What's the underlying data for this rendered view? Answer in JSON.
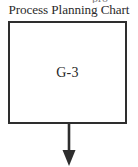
{
  "chart": {
    "title": "Process Planning Chart",
    "clipped_text_above": "pro",
    "background_color": "#ffffff",
    "line_color": "#2e2e2e",
    "text_color": "#2b2b2b"
  },
  "nodes": [
    {
      "id": "node-g3",
      "label": "G-3",
      "shape": "rectangle",
      "border_color": "#2e2e2e",
      "fill_color": "#ffffff"
    }
  ],
  "connectors": [
    {
      "id": "arrow-down-from-g3",
      "type": "arrow",
      "direction": "down",
      "from": "node-g3",
      "to": "",
      "label": "",
      "color": "#2e2e2e"
    }
  ]
}
